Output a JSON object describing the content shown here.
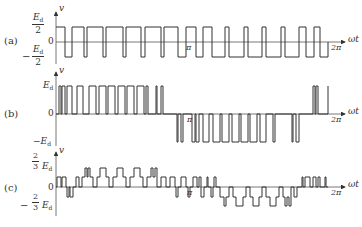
{
  "figure": {
    "panels": [
      {
        "id": "a",
        "label": "(a)",
        "y_axis_label": "v",
        "x_axis_label": "ωt",
        "top_tick": {
          "num": "E",
          "sub": "d",
          "den": "2"
        },
        "zero_tick": "0",
        "bottom_tick": {
          "sign": "−",
          "num": "E",
          "sub": "d",
          "den": "2"
        },
        "pi_label": "π",
        "two_pi_label": "2π",
        "description": "Two-level bipolar PWM: ±Ed/2"
      },
      {
        "id": "b",
        "label": "(b)",
        "y_axis_label": "v",
        "x_axis_label": "ωt",
        "top_tick": {
          "text": "E",
          "sub": "d"
        },
        "zero_tick": "0",
        "bottom_tick": {
          "sign": "−",
          "text": "E",
          "sub": "d"
        },
        "pi_label": "π",
        "two_pi_label": "2π",
        "description": "Unipolar PWM: 0/+Ed in first half, 0/−Ed in second half"
      },
      {
        "id": "c",
        "label": "(c)",
        "y_axis_label": "v",
        "x_axis_label": "ωt",
        "top_tick": {
          "fnum": "2",
          "fden": "3",
          "text": "E",
          "sub": "d"
        },
        "zero_tick": "0",
        "bottom_tick": {
          "sign": "−",
          "fnum": "2",
          "fden": "3",
          "text": "E",
          "sub": "d"
        },
        "pi_label": "π",
        "two_pi_label": "2π",
        "description": "Multilevel line voltage: levels 0, ±1/3Ed, ±2/3Ed"
      }
    ],
    "colors": {
      "line": "#333333",
      "axis": "#555555",
      "background": "#ffffff"
    }
  }
}
